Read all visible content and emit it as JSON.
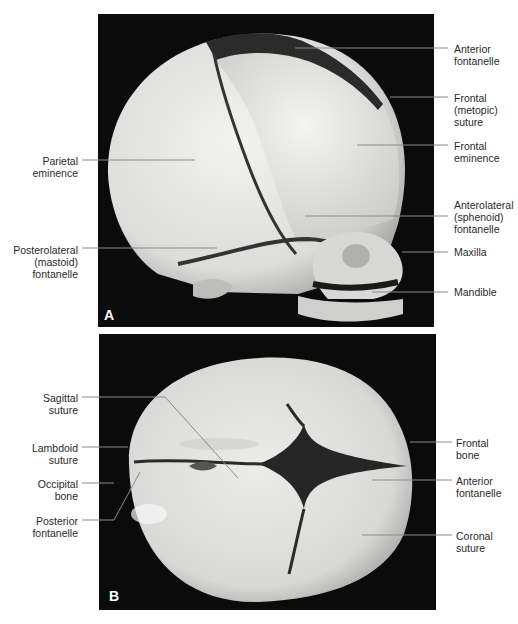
{
  "figure": {
    "panel_a": {
      "letter": "A",
      "view": "lateral view of neonatal skull",
      "labels_left": [
        {
          "id": "parietal-eminence",
          "text": "Parietal\neminence"
        },
        {
          "id": "posterolateral-fontanelle",
          "text": "Posterolateral\n(mastoid)\nfontanelle"
        }
      ],
      "labels_right": [
        {
          "id": "anterior-fontanelle",
          "text": "Anterior\nfontanelle"
        },
        {
          "id": "frontal-metopic-suture",
          "text": "Frontal\n(metopic)\nsuture"
        },
        {
          "id": "frontal-eminence",
          "text": "Frontal\neminence"
        },
        {
          "id": "anterolateral-fontanelle",
          "text": "Anterolateral\n(sphenoid)\nfontanelle"
        },
        {
          "id": "maxilla",
          "text": "Maxilla"
        },
        {
          "id": "mandible",
          "text": "Mandible"
        }
      ]
    },
    "panel_b": {
      "letter": "B",
      "view": "superior view of neonatal skull",
      "labels_left": [
        {
          "id": "sagittal-suture",
          "text": "Sagittal\nsuture"
        },
        {
          "id": "lambdoid-suture",
          "text": "Lambdoid\nsuture"
        },
        {
          "id": "occipital-bone",
          "text": "Occipital\nbone"
        },
        {
          "id": "posterior-fontanelle",
          "text": "Posterior\nfontanelle"
        }
      ],
      "labels_right": [
        {
          "id": "frontal-bone",
          "text": "Frontal\nbone"
        },
        {
          "id": "anterior-fontanelle-b",
          "text": "Anterior\nfontanelle"
        },
        {
          "id": "coronal-suture",
          "text": "Coronal\nsuture"
        }
      ]
    },
    "colors": {
      "background": "#ffffff",
      "photo_background": "#0b0b0b",
      "bone": "#e2e2e0",
      "suture": "#2a2a2a",
      "label_text": "#2a2a2a",
      "leader_line": "#8a8a8a"
    }
  }
}
